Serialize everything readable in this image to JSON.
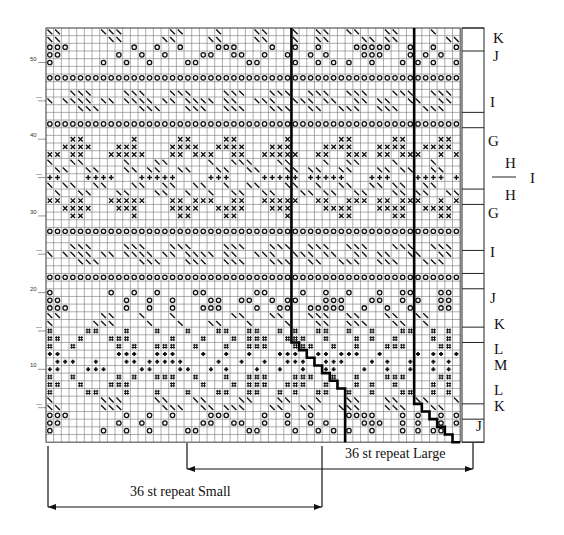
{
  "chart": {
    "columns": 54,
    "rows": 54,
    "origin": {
      "x": 46,
      "y": 28
    },
    "cell": 7.67,
    "row_labels": [
      {
        "row": 50,
        "text": "50"
      },
      {
        "row": 45,
        "text": "—"
      },
      {
        "row": 40,
        "text": "40"
      },
      {
        "row": 35,
        "text": "—"
      },
      {
        "row": 30,
        "text": "30"
      },
      {
        "row": 25,
        "text": "—"
      },
      {
        "row": 20,
        "text": "20"
      },
      {
        "row": 15,
        "text": "—"
      },
      {
        "row": 10,
        "text": "10"
      },
      {
        "row": 5,
        "text": "—"
      }
    ],
    "symbols": {
      "o": "circle-stitch",
      "/": "diagonal-stitch",
      "x": "cross-stitch",
      "+": "plus-stitch",
      "*": "dot-stitch",
      "#": "square-stitch"
    },
    "pattern_rows_top_to_bottom": [
      "//.....///......//..../....//.../..//..//...//..../...",
      "//......//.....//....//....//.../..//....//.//......//",
      "ooo........o..o..o....ooo....o..o..o....ooooo..o..o..o",
      "oo.......o..o..o....oo..oo..o..o..o.o....ooo...o.o.o..",
      "o......o..o..o....oo......oo....o..o.o.o..o...o.o.o..o",
      "......................................................",
      "oooooooooooooooooooooooooooooooooooooooooooooooooooooo",
      "......................................................",
      "...///....///...///....///...///..///..///...///..///.",
      "/.////.//.////.//.////.//..///..///.//..//.//..//..//.",
      "....///.....///...///..///...///..//..///..///...///..",
      "......................................................",
      "oooooooooooooooooooooooooooooooooooooooooooooooooooooo",
      "......................................................",
      "...xx......x.....xx....xx......x......xx.....xx....xx.",
      "..xxxx...xxx....xxxx..xxxx...xxx....xxxx...xxxx..xxxx.",
      "xx.xx...xxxxx...xx.xxx..xx..xxxxx..xx..xxx.xx.xxx..x.x",
      "/..//...../...//...../..///...//..../..//..../..../...",
      ".//..//...//.//..//...//..//...//.//..//...//.//..//..",
      "++...++++...+++++....+++....+++++.+++++...+++...++++.+",
      "/.//..//...//..//..//../..//...//../..//..//.//..//...",
      "./..//...//...//../../..//..//...//.//..//...//.//..//",
      "xx.xx...xxxxx...xx.xxx..xx..xxxxx..xx..xxx.xx.xxx..x.x",
      "..xxxx...xxx....xxxx..xxxx...xxx....xxxx...xxxx..xxxx.",
      "...xx......x.....xx....xx......x......xx.....xx....xx.",
      "......................................................",
      "oooooooooooooooooooooooooooooooooooooooooooooooooooooo",
      "......................................................",
      "...///....///...///....///...///..///..///...///..///.",
      "/.////.//.////.//.////.//..///..///.//..//.//..//..//.",
      "....///.....///...///..///...///..//..///..///...///..",
      "......................................................",
      "oooooooooooooooooooooooooooooooooooooooooooooooooooooo",
      "......................................................",
      "o.......o..o..o....oo......oo....o..o..o...o..oo...oo.",
      "oo........o..o..o....oo..oo..o.oo...ooo...oo..o.o..oo.",
      "ooo.......o..o..o...ooo....o..oo..ooooo..o..o..o...oo.",
      "//.....//.../.../.......//...//...///..//...//..//...",
      "/.....///..../.../...//.../..../...//..///...//../...",
      "#....##...#...#...#...##..##..#.#..##..#..#...##..#.#.",
      "##..#...###.....#...#...#.###..###..#...#.#..#....#.#.",
      "#..#.....#.#..###..#...#..###...###..#..#...###....##.",
      "**.......***..***...*..*..*...***..**.***..*....*.**.*",
      ".***..*...**.*****....*..*..*..***..***...*.*..*..*.*.",
      "**...***....**...**..*.*...*..*..*..**...*..*..*..*.*.",
      "#..#.....#.#..###..#...#..###...###..#..#...###....##.",
      "##..#...###.....#...#...#.###..###..#...#.#..#....#.#.",
      "#....##...#...#...#...##..##..#.#..##..#..#...##..#.#.",
      "/......///....//...//....//...//.../...//...//..//.../",
      "//.....///.....///..//.///...//..//...///...///...//..",
      "ooo.......o..o..o....ooo....o..o..o....oooo...o.o..o.o",
      "oo.......o..o..o....oo..oo..o..o..o.o....ooo..o.o..o.o",
      "o......o..o..o....oo......oo....o..o.o.o..o...o.o.oo..",
      "......................................................"
    ]
  },
  "repeat_lines": {
    "small_top_col": 32,
    "large_top_col": 48,
    "small_steps": [
      [
        32,
        40
      ],
      [
        32,
        41
      ],
      [
        33,
        41
      ],
      [
        33,
        42
      ],
      [
        34,
        42
      ],
      [
        34,
        43
      ],
      [
        35,
        43
      ],
      [
        35,
        44
      ],
      [
        36,
        44
      ],
      [
        36,
        45
      ],
      [
        37,
        45
      ],
      [
        37,
        46
      ],
      [
        38,
        46
      ],
      [
        38,
        47
      ],
      [
        39,
        47
      ],
      [
        39,
        54
      ]
    ],
    "large_steps": [
      [
        48,
        45
      ],
      [
        48,
        49
      ],
      [
        49,
        49
      ],
      [
        49,
        50
      ],
      [
        50,
        50
      ],
      [
        50,
        51
      ],
      [
        51,
        51
      ],
      [
        51,
        52
      ],
      [
        52,
        52
      ],
      [
        52,
        53
      ],
      [
        53,
        53
      ],
      [
        53,
        54
      ],
      [
        54,
        54
      ]
    ]
  },
  "section_box": {
    "x": 462,
    "y": 28,
    "width": 22,
    "dividers_rows": [
      0,
      3,
      11,
      13,
      21,
      23,
      29,
      32,
      34,
      39,
      41,
      49,
      51,
      54
    ]
  },
  "section_labels": [
    {
      "id": "K",
      "text": "K",
      "x": 493,
      "y": 30
    },
    {
      "id": "J",
      "text": "J",
      "x": 493,
      "y": 48
    },
    {
      "id": "I",
      "text": "I",
      "x": 490,
      "y": 94
    },
    {
      "id": "G",
      "text": "G",
      "x": 488,
      "y": 133
    },
    {
      "id": "H-top",
      "text": "H",
      "x": 505,
      "y": 155
    },
    {
      "id": "I-side",
      "text": "I",
      "x": 530,
      "y": 170
    },
    {
      "id": "H-bottom",
      "text": "H",
      "x": 505,
      "y": 187
    },
    {
      "id": "G-2",
      "text": "G",
      "x": 488,
      "y": 205
    },
    {
      "id": "I-2",
      "text": "I",
      "x": 490,
      "y": 244
    },
    {
      "id": "J-2",
      "text": "J",
      "x": 490,
      "y": 290
    },
    {
      "id": "K-2",
      "text": "K",
      "x": 494,
      "y": 316
    },
    {
      "id": "L",
      "text": "L",
      "x": 494,
      "y": 341
    },
    {
      "id": "M",
      "text": "M",
      "x": 494,
      "y": 357
    },
    {
      "id": "L-2",
      "text": "L",
      "x": 494,
      "y": 382
    },
    {
      "id": "K-3",
      "text": "K",
      "x": 494,
      "y": 398
    },
    {
      "id": "J-3",
      "text": "J",
      "x": 476,
      "y": 418
    }
  ],
  "repeats": {
    "large": {
      "label": "36 st repeat Large",
      "x1": 187,
      "x2": 473,
      "y": 469
    },
    "small": {
      "label": "36 st repeat Small",
      "x1": 48,
      "x2": 322,
      "y": 507
    }
  }
}
